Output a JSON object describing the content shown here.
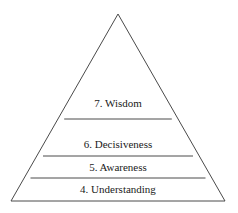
{
  "diagram": {
    "type": "pyramid",
    "levels": [
      {
        "label": "7. Wisdom"
      },
      {
        "label": "6.  Decisiveness"
      },
      {
        "label": "5.  Awareness"
      },
      {
        "label": "4.  Understanding"
      }
    ],
    "colors": {
      "stroke": "#4a4a4a",
      "fill": "#ffffff",
      "text": "#1a1a1a"
    }
  }
}
